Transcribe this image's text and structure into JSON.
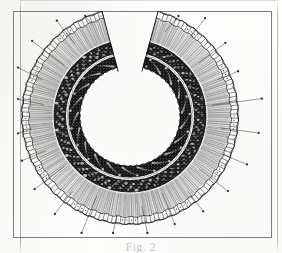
{
  "document": {
    "kind": "scanned-figure-plate",
    "background_color": "#fdfdfc",
    "ink_color": "#1a1a1a"
  },
  "frame": {
    "border_color": "#7d7d7d",
    "left": 13,
    "top": 11,
    "width": 259,
    "height": 227
  },
  "figure": {
    "name": "horseshoe-cross-section",
    "orientation": "gap at top",
    "center": {
      "x": 130,
      "y": 116
    },
    "outer_radius": 108,
    "inner_radius": 47,
    "gap_start_deg": 255,
    "gap_end_deg": 285,
    "layers": [
      {
        "name": "outer-rim-scalloped-edge",
        "tone": "outline",
        "radius_outer": 108,
        "radius_inner": 101
      },
      {
        "name": "outer-cortex-radial-fibers",
        "tone": "light",
        "radius_outer": 101,
        "radius_inner": 76
      },
      {
        "name": "dark-stippled-band-outer",
        "tone": "dark",
        "radius_outer": 76,
        "radius_inner": 64
      },
      {
        "name": "pale-separating-line",
        "tone": "light",
        "radius_outer": 64,
        "radius_inner": 61
      },
      {
        "name": "dark-stippled-band-inner",
        "tone": "dark",
        "radius_outer": 61,
        "radius_inner": 50
      },
      {
        "name": "central-lumen",
        "tone": "blank",
        "radius_outer": 47,
        "radius_inner": 0
      }
    ],
    "leader_lines": {
      "count": 22,
      "style": "thin straight line with small filled dot at outer terminus",
      "color": "#3a3a3a"
    }
  },
  "caption": {
    "text": "Fig. 2",
    "note": "clipped by page edge — only the tops of the glyphs are visible",
    "visible": true
  }
}
